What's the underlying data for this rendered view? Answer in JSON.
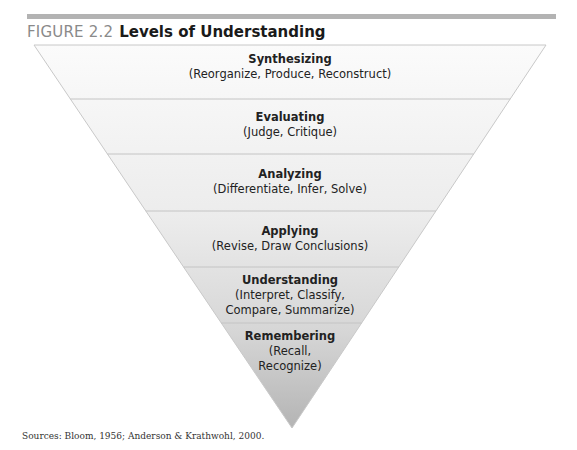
{
  "figure": {
    "number": "FIGURE 2.2",
    "title": "Levels of Understanding",
    "colors": {
      "rule": "#b3b3b3",
      "figure_number": "#8a8a8a",
      "band_top": "#fbfbfb",
      "band_bottom": "#b8b8b8",
      "divider": "#c4c4c4"
    }
  },
  "levels": [
    {
      "name": "Synthesizing",
      "verbs": "(Reorganize, Produce, Reconstruct)"
    },
    {
      "name": "Evaluating",
      "verbs": "(Judge, Critique)"
    },
    {
      "name": "Analyzing",
      "verbs": "(Differentiate, Infer, Solve)"
    },
    {
      "name": "Applying",
      "verbs": "(Revise, Draw Conclusions)"
    },
    {
      "name": "Understanding",
      "verbs_line1": "(Interpret, Classify,",
      "verbs_line2": "Compare, Summarize)"
    },
    {
      "name": "Remembering",
      "verbs_line1": "(Recall,",
      "verbs_line2": "Recognize)"
    }
  ],
  "source": "Sources: Bloom, 1956; Anderson & Krathwohl, 2000."
}
